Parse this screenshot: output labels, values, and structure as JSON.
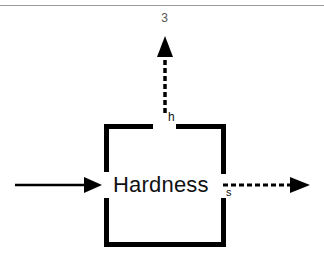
{
  "figure": {
    "number": "3",
    "box_label": "Hardness",
    "top_output_label": "h",
    "right_output_label": "s"
  },
  "colors": {
    "stroke": "#000000",
    "rule": "#9a9a9a",
    "text": "#111111"
  },
  "elements": {
    "input_arrow": {
      "style": "solid",
      "direction": "right"
    },
    "top_output_arrow": {
      "style": "dashed",
      "direction": "up"
    },
    "right_output_arrow": {
      "style": "dashed",
      "direction": "right"
    },
    "process_box": {
      "style": "thick-open-frame"
    }
  }
}
